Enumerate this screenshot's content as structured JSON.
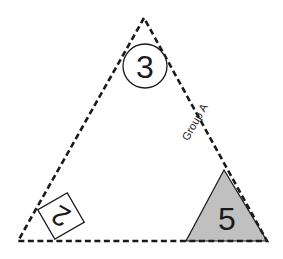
{
  "diagram": {
    "main_triangle": {
      "style": "dashed",
      "vertices": [
        [
          144,
          18
        ],
        [
          18,
          241
        ],
        [
          267,
          241
        ]
      ],
      "stroke": "#1a1a1a"
    },
    "edge_label": {
      "text": "Group A",
      "edge": "right"
    },
    "circle_marker": {
      "label": "3",
      "position": "top-vertex"
    },
    "square_marker": {
      "label": "2",
      "position": "bottom-left-vertex"
    },
    "shaded_triangle": {
      "label": "5",
      "position": "bottom-right-vertex",
      "fill": "#c0c0c0"
    }
  }
}
